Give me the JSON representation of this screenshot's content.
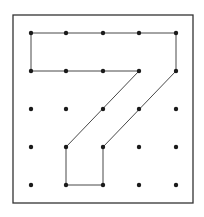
{
  "diagram": {
    "type": "geoboard",
    "grid": {
      "cols": 5,
      "rows": 5,
      "x_positions": [
        31,
        66,
        103,
        139,
        176
      ],
      "y_positions": [
        33,
        71,
        109,
        147,
        185
      ],
      "dot_radius": 2.2,
      "dot_color": "#1a1a1a"
    },
    "frame": {
      "x": 13,
      "y": 15,
      "width": 180,
      "height": 188,
      "stroke": "#333333",
      "stroke_width": 1.3
    },
    "shape": {
      "label": "7",
      "stroke": "#333333",
      "stroke_width": 0.9,
      "vertices_grid": [
        [
          0,
          0
        ],
        [
          4,
          0
        ],
        [
          4,
          1
        ],
        [
          2,
          3
        ],
        [
          2,
          4
        ],
        [
          1,
          4
        ],
        [
          1,
          3
        ],
        [
          3,
          1
        ],
        [
          0,
          1
        ]
      ]
    }
  }
}
